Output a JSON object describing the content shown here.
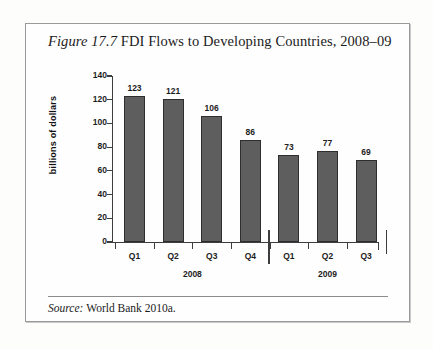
{
  "figure": {
    "number_label": "Figure 17.7",
    "title_text": "FDI Flows to Developing Countries, 2008–09",
    "source_label": "Source:",
    "source_text": "World Bank 2010a."
  },
  "colors": {
    "bar_fill": "#5e5e5e",
    "bar_stroke": "#2e2e2e",
    "axis": "#3d3d3d",
    "frame": "#9a9a9a",
    "text": "#1b1b1b"
  },
  "chart_data": {
    "type": "bar",
    "title": "FDI Flows to Developing Countries, 2008–09",
    "xlabel": "",
    "ylabel": "billions of dollars",
    "categories": [
      "Q1",
      "Q2",
      "Q3",
      "Q4",
      "Q1",
      "Q2",
      "Q3"
    ],
    "groups": [
      {
        "label": "2008",
        "categories": [
          "Q1",
          "Q2",
          "Q3",
          "Q4"
        ]
      },
      {
        "label": "2009",
        "categories": [
          "Q1",
          "Q2",
          "Q3"
        ]
      }
    ],
    "values": [
      123,
      121,
      106,
      86,
      73,
      77,
      69
    ],
    "data_labels": [
      "123",
      "121",
      "106",
      "86",
      "73",
      "77",
      "69"
    ],
    "ylim": [
      0,
      140
    ],
    "yticks": [
      0,
      20,
      40,
      60,
      80,
      100,
      120,
      140
    ],
    "ytick_labels": [
      "0",
      "20",
      "40",
      "60",
      "80",
      "100",
      "120",
      "140"
    ],
    "grid": false,
    "legend": false
  }
}
